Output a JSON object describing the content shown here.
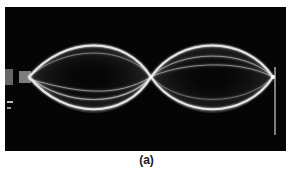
{
  "figure": {
    "caption": "(a)",
    "loops": 2,
    "nodes_interior": 1,
    "colors": {
      "background": "#050505",
      "wave": "#e8e8e8",
      "page": "#ffffff"
    }
  }
}
